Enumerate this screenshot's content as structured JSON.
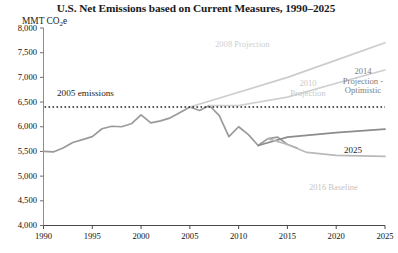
{
  "chart_data": {
    "type": "line",
    "title": "U.S. Net Emissions based on Current Measures, 1990–2025",
    "ylabel": "MMT CO2e",
    "ylabel_main": "MMT CO",
    "ylabel_sub": "2",
    "ylabel_tail": "e",
    "xlabel": "",
    "xlim": [
      1990,
      2025
    ],
    "ylim": [
      4000,
      8000
    ],
    "grid": false,
    "legend_position": "inline-annotations",
    "yticks": [
      4000,
      4500,
      5000,
      5500,
      6000,
      6500,
      7000,
      7500,
      8000
    ],
    "ytick_labels": [
      "4,000",
      "4,500",
      "5,000",
      "5,500",
      "6,000",
      "6,500",
      "7,000",
      "7,500",
      "8,000"
    ],
    "xticks": [
      1990,
      1995,
      2000,
      2005,
      2010,
      2015,
      2020,
      2025
    ],
    "xtick_labels": [
      "1990",
      "1995",
      "2000",
      "2005",
      "2010",
      "2015",
      "2020",
      "2025"
    ],
    "reference_line": {
      "label": "2005 emissions",
      "value": 6400,
      "style": "dotted",
      "color": "#1f1f1f"
    },
    "series": [
      {
        "name": "Historical emissions",
        "color": "#9a9a9a",
        "x": [
          1990,
          1991,
          1992,
          1993,
          1994,
          1995,
          1996,
          1997,
          1998,
          1999,
          2000,
          2001,
          2002,
          2003,
          2004,
          2005,
          2006,
          2007,
          2008,
          2009,
          2010,
          2011,
          2012,
          2013,
          2014,
          2015,
          2016
        ],
        "values": [
          5500,
          5490,
          5570,
          5680,
          5740,
          5800,
          5960,
          6010,
          6000,
          6060,
          6240,
          6080,
          6120,
          6180,
          6290,
          6400,
          6330,
          6430,
          6230,
          5800,
          6000,
          5840,
          5620,
          5760,
          5790,
          5640,
          5570
        ]
      },
      {
        "name": "2008 Projection",
        "color": "#cccccc",
        "x": [
          2005,
          2010,
          2015,
          2020,
          2025
        ],
        "values": [
          6400,
          6700,
          7000,
          7350,
          7700
        ]
      },
      {
        "name": "2010 Projection",
        "color": "#cfcfcf",
        "x": [
          2007,
          2010,
          2015,
          2020,
          2025
        ],
        "values": [
          6430,
          6430,
          6600,
          6880,
          7150
        ]
      },
      {
        "name": "2014 Projection - Optimistic",
        "color": "#8c8c8c",
        "x": [
          2012,
          2015,
          2020,
          2025
        ],
        "values": [
          5620,
          5790,
          5880,
          5950
        ]
      },
      {
        "name": "2016 Baseline",
        "color": "#b9b9b9",
        "x": [
          2013,
          2015,
          2017,
          2020,
          2025
        ],
        "values": [
          5760,
          5640,
          5480,
          5420,
          5400
        ]
      }
    ],
    "annotations": [
      {
        "name": "2005 emissions",
        "text": "2005 emissions"
      },
      {
        "name": "2008 Projection",
        "text": "2008 Projection"
      },
      {
        "name": "2010 Projection",
        "line1": "2010",
        "line2": "Projection"
      },
      {
        "name": "2014 Projection - Optimistic",
        "line1": "2014",
        "line2": "Projection -",
        "line3": "Optimistic"
      },
      {
        "name": "2025",
        "text": "2025"
      },
      {
        "name": "2016 Baseline",
        "text": "2016 Baseline"
      }
    ]
  }
}
